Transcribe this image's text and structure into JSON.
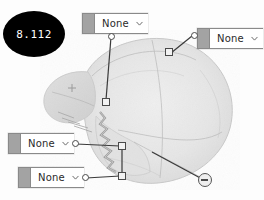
{
  "badge": {
    "value": "8.112",
    "name": "value-badge",
    "background": "#000000",
    "text_color": "#ffffff"
  },
  "annotations": {
    "dropdown_placeholder": "None",
    "items": [
      {
        "id": "dd-top",
        "value": "None",
        "chevron": "chevron-down-icon",
        "grip": "drag-grip"
      },
      {
        "id": "dd-right",
        "value": "None",
        "chevron": "chevron-down-icon",
        "grip": "drag-grip"
      },
      {
        "id": "dd-mid-left",
        "value": "None",
        "chevron": "chevron-down-icon",
        "grip": "drag-grip"
      },
      {
        "id": "dd-low-left",
        "value": "None",
        "chevron": "chevron-down-icon",
        "grip": "drag-grip"
      }
    ]
  },
  "markers": {
    "square_points": [
      {
        "id": "mark-a",
        "x": 106,
        "y": 102
      },
      {
        "id": "mark-b",
        "x": 169,
        "y": 52
      },
      {
        "id": "mark-c",
        "x": 122,
        "y": 146
      },
      {
        "id": "mark-d",
        "x": 122,
        "y": 176
      }
    ],
    "minus_button": {
      "id": "minus-btn",
      "icon": "minus-icon",
      "x": 205,
      "y": 180
    }
  },
  "colors": {
    "canvas": "#fdfdfd",
    "widget_border": "#8a8a8a",
    "widget_grip": "#a3a3a3",
    "marker_stroke": "#4a4a4a",
    "specimen_fill": "#e4e4e4",
    "leader_line": "#3a3a3a"
  }
}
